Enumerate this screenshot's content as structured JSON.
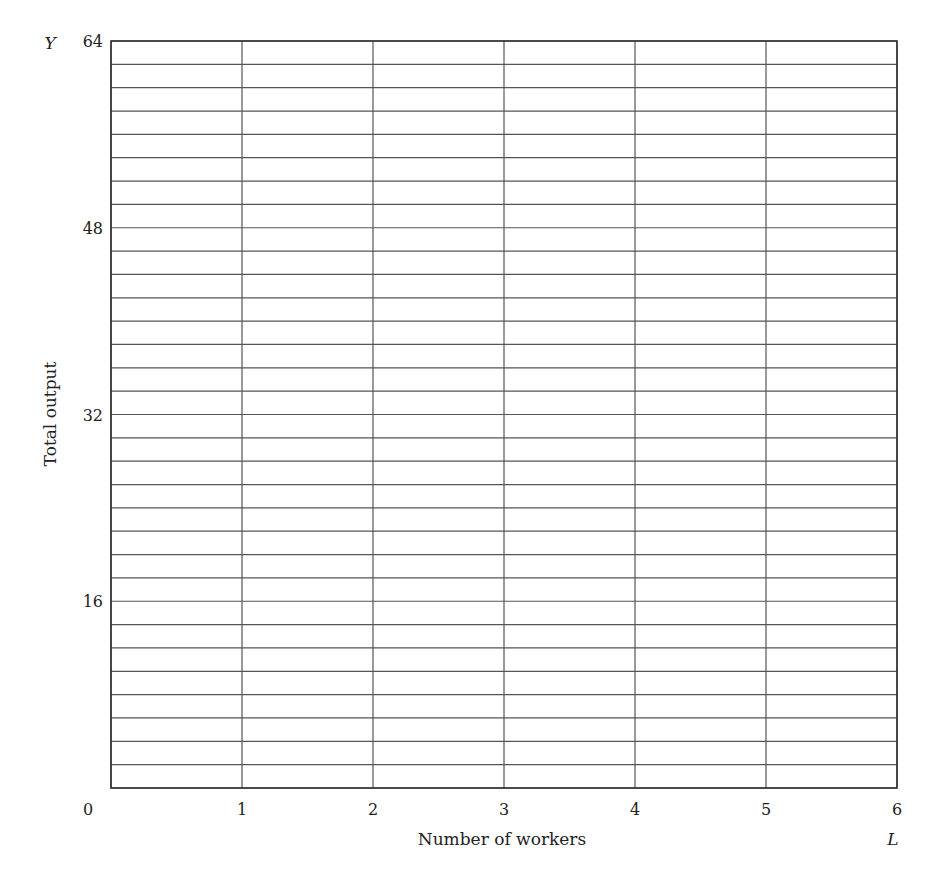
{
  "chart_data": {
    "type": "line",
    "title": "",
    "xlabel": "Number of workers",
    "ylabel": "Total output",
    "x_axis_symbol": "L",
    "y_axis_symbol": "Y",
    "xlim": [
      0,
      6
    ],
    "ylim": [
      0,
      64
    ],
    "x_ticks": [
      0,
      1,
      2,
      3,
      4,
      5,
      6
    ],
    "y_ticks": [
      16,
      32,
      48,
      64
    ],
    "origin_label": "0",
    "grid": true,
    "x_grid_step": 1,
    "y_grid_step": 2,
    "series": []
  },
  "colors": {
    "grid": "#555555",
    "text": "#222222",
    "background": "#ffffff"
  }
}
